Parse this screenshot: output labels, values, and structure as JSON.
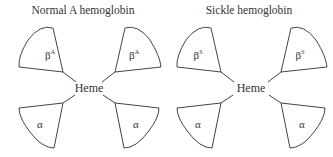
{
  "panels": [
    {
      "title": "Normal A hemoglobin",
      "center_label": "Heme",
      "subunits": {
        "top_left": {
          "base": "β",
          "sup": "A"
        },
        "top_right": {
          "base": "β",
          "sup": "A"
        },
        "bottom_left": {
          "base": "α",
          "sup": ""
        },
        "bottom_right": {
          "base": "α",
          "sup": ""
        }
      }
    },
    {
      "title": "Sickle hemoglobin",
      "center_label": "Heme",
      "subunits": {
        "top_left": {
          "base": "β",
          "sup": "S"
        },
        "top_right": {
          "base": "β",
          "sup": "S"
        },
        "bottom_left": {
          "base": "α",
          "sup": ""
        },
        "bottom_right": {
          "base": "α",
          "sup": ""
        }
      }
    }
  ],
  "colors": {
    "stroke": "#444444",
    "text": "#333333",
    "background": "#ffffff"
  }
}
